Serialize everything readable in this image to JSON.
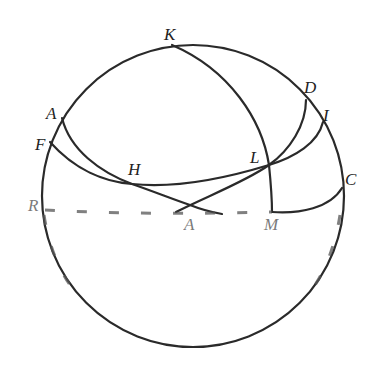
{
  "diagram": {
    "type": "spherical-geometry",
    "sphere": {
      "cx": 193,
      "cy": 196,
      "r": 151
    },
    "points": [
      {
        "id": "K",
        "label": "K",
        "x": 172,
        "y": 45,
        "lx": 164,
        "ly": 40
      },
      {
        "id": "A",
        "label": "A",
        "x": 62,
        "y": 118,
        "lx": 46,
        "ly": 119
      },
      {
        "id": "F",
        "label": "F",
        "x": 50,
        "y": 142,
        "lx": 35,
        "ly": 150
      },
      {
        "id": "H",
        "label": "H",
        "x": 132,
        "y": 184,
        "lx": 128,
        "ly": 175
      },
      {
        "id": "L",
        "label": "L",
        "x": 269,
        "y": 165,
        "lx": 250,
        "ly": 163
      },
      {
        "id": "D",
        "label": "D",
        "x": 306,
        "y": 100,
        "lx": 304,
        "ly": 93
      },
      {
        "id": "I",
        "label": "I",
        "x": 323,
        "y": 122,
        "lx": 323,
        "ly": 121
      },
      {
        "id": "C",
        "label": "C",
        "x": 342,
        "y": 188,
        "lx": 345,
        "ly": 185
      },
      {
        "id": "R",
        "label": "R",
        "x": 42,
        "y": 210,
        "lx": 28,
        "ly": 211
      },
      {
        "id": "M",
        "label": "M",
        "x": 272,
        "y": 212,
        "lx": 264,
        "ly": 230
      },
      {
        "id": "N",
        "label": "A",
        "x": 190,
        "y": 205,
        "lx": 184,
        "ly": 230
      }
    ],
    "colors": {
      "stroke": "#2a2a2a",
      "label": "#222222",
      "background": "#ffffff"
    }
  }
}
